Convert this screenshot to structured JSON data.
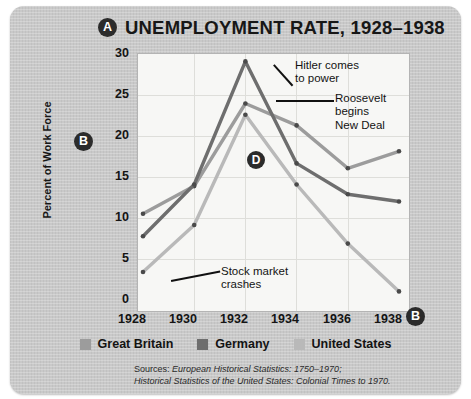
{
  "title": "UNEMPLOYMENT RATE, 1928–1938",
  "badges": {
    "a": "A",
    "b_left": "B",
    "b_bottom": "B",
    "d": "D"
  },
  "axes": {
    "ylabel": "Percent of Work Force",
    "yticks": [
      "30",
      "25",
      "20",
      "15",
      "10",
      "5",
      "0"
    ],
    "xticks": [
      "1928",
      "1930",
      "1932",
      "1934",
      "1936",
      "1938"
    ]
  },
  "annotations": {
    "hitler": "Hitler comes\nto power",
    "roosevelt": "Roosevelt\nbegins\nNew Deal",
    "stock": "Stock market\ncrashes"
  },
  "legend": [
    {
      "label": "Great Britain",
      "color": "#9c9c9c"
    },
    {
      "label": "Germany",
      "color": "#6e6e6e"
    },
    {
      "label": "United States",
      "color": "#b9b9b9"
    }
  ],
  "sources": {
    "line1_prefix": "Sources: ",
    "line1_italic": "European Historical Statistics: 1750–1970;",
    "line2_italic": "Historical Statistics of the United States: Colonial Times to 1970."
  },
  "chart_data": {
    "type": "line",
    "title": "UNEMPLOYMENT RATE, 1928–1938",
    "xlabel": "",
    "ylabel": "Percent of Work Force",
    "xlim": [
      1928,
      1938
    ],
    "ylim": [
      0,
      30
    ],
    "yticks": [
      0,
      5,
      10,
      15,
      20,
      25,
      30
    ],
    "xticks": [
      1928,
      1930,
      1932,
      1934,
      1936,
      1938
    ],
    "grid": true,
    "legend_position": "bottom",
    "x": [
      1928,
      1930,
      1932,
      1934,
      1936,
      1938
    ],
    "series": [
      {
        "name": "Great Britain",
        "color": "#9c9c9c",
        "values": [
          11.4,
          14.8,
          25.0,
          22.3,
          17.0,
          19.1
        ]
      },
      {
        "name": "Germany",
        "color": "#6e6e6e",
        "values": [
          8.6,
          15.0,
          30.2,
          17.6,
          13.8,
          12.9
        ]
      },
      {
        "name": "United States",
        "color": "#b9b9b9",
        "values": [
          4.2,
          10.0,
          23.6,
          15.0,
          7.7,
          1.8
        ]
      }
    ],
    "annotations": [
      {
        "text": "Hitler comes to power",
        "x": 1933
      },
      {
        "text": "Roosevelt begins New Deal",
        "x": 1933
      },
      {
        "text": "Stock market crashes",
        "x": 1929
      }
    ]
  }
}
